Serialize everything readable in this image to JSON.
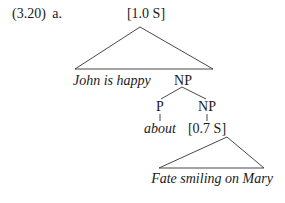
{
  "example": {
    "number": "(3.20)",
    "letter": "a."
  },
  "tree": {
    "root": {
      "label": "[1.0 S]"
    },
    "root_triangle_text": "John is happy",
    "np_top": {
      "label": "NP"
    },
    "p": {
      "label": "P",
      "word": "about"
    },
    "np_inner": {
      "label": "NP",
      "child": "[0.7 S]"
    },
    "inner_triangle_text": "Fate smiling on Mary"
  },
  "colors": {
    "text": "#1a1a1a",
    "lines": "#333333",
    "background": "#ffffff"
  }
}
